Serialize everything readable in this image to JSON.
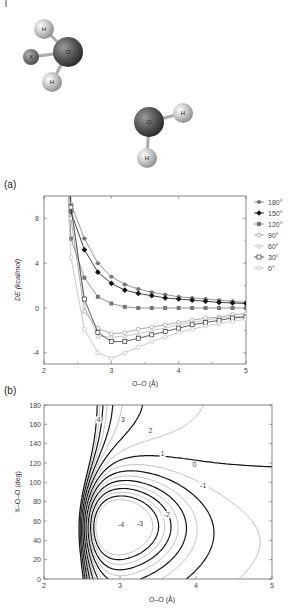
{
  "figure": {
    "molecules": [
      {
        "atoms": [
          {
            "label": "H",
            "x": 44,
            "y": 29,
            "r": 10,
            "fill": "#d8d8d8"
          },
          {
            "label": "X",
            "x": 31,
            "y": 57,
            "r": 8,
            "fill": "#777"
          },
          {
            "label": "O",
            "x": 68,
            "y": 52,
            "r": 15,
            "fill": "#555"
          },
          {
            "label": "H",
            "x": 52,
            "y": 82,
            "r": 10,
            "fill": "#d8d8d8"
          }
        ],
        "bonds": [
          [
            2,
            0
          ],
          [
            2,
            1
          ],
          [
            2,
            3
          ]
        ]
      },
      {
        "atoms": [
          {
            "label": "O",
            "x": 149,
            "y": 122,
            "r": 15,
            "fill": "#555"
          },
          {
            "label": "H",
            "x": 183,
            "y": 113,
            "r": 10,
            "fill": "#d8d8d8"
          },
          {
            "label": "H",
            "x": 147,
            "y": 158,
            "r": 10,
            "fill": "#d8d8d8"
          }
        ],
        "bonds": [
          [
            0,
            1
          ],
          [
            0,
            2
          ]
        ]
      }
    ],
    "panel_a_label": "(a)",
    "panel_b_label": "(b)"
  },
  "chart_data": [
    {
      "type": "line",
      "title": "(a)",
      "xlabel": "O–O (Å)",
      "ylabel": "DE (kcal/mol)",
      "xlim": [
        2,
        5
      ],
      "ylim": [
        -5,
        10
      ],
      "xticks": [
        2,
        3,
        4,
        5
      ],
      "yticks": [
        -4,
        0,
        4,
        8
      ],
      "legend_position": "right",
      "x": [
        2.4,
        2.6,
        2.8,
        3.0,
        3.2,
        3.4,
        3.6,
        3.8,
        4.0,
        4.2,
        4.4,
        4.6,
        4.8,
        5.0
      ],
      "series": [
        {
          "name": "180°",
          "color": "#777",
          "marker": "star",
          "values": [
            9.3,
            6.2,
            4.0,
            2.8,
            2.1,
            1.7,
            1.4,
            1.2,
            1.0,
            0.9,
            0.8,
            0.7,
            0.6,
            0.5
          ]
        },
        {
          "name": "150°",
          "color": "#111",
          "marker": "diamond",
          "values": [
            8.6,
            5.2,
            3.2,
            2.2,
            1.6,
            1.3,
            1.1,
            0.9,
            0.8,
            0.7,
            0.6,
            0.5,
            0.45,
            0.4
          ]
        },
        {
          "name": "120°",
          "color": "#777",
          "marker": "square-filled",
          "values": [
            6.2,
            2.7,
            1.0,
            0.4,
            0.1,
            0.0,
            0.0,
            0.0,
            0.0,
            0.0,
            0.0,
            0.0,
            0.0,
            0.0
          ]
        },
        {
          "name": "90°",
          "color": "#999",
          "marker": "circle-open",
          "values": [
            8.0,
            -0.3,
            -1.8,
            -2.3,
            -2.2,
            -1.9,
            -1.7,
            -1.5,
            -1.3,
            -1.1,
            -0.9,
            -0.8,
            -0.6,
            -0.5
          ]
        },
        {
          "name": "60°",
          "color": "#bbb",
          "marker": "triangle-open",
          "values": [
            9.5,
            0.2,
            -2.5,
            -2.6,
            -2.5,
            -2.3,
            -2.0,
            -1.8,
            -1.5,
            -1.3,
            -1.1,
            -0.9,
            -0.8,
            -0.7
          ]
        },
        {
          "name": "30°",
          "color": "#333",
          "marker": "square-open",
          "values": [
            9.0,
            0.8,
            -2.2,
            -3.0,
            -3.0,
            -2.7,
            -2.4,
            -2.1,
            -1.8,
            -1.5,
            -1.3,
            -1.1,
            -0.9,
            -0.8
          ]
        },
        {
          "name": "0°",
          "color": "#bbb",
          "marker": "circle-open",
          "values": [
            4.5,
            -1.9,
            -4.0,
            -4.5,
            -4.0,
            -3.5,
            -3.0,
            -2.6,
            -2.2,
            -1.9,
            -1.6,
            -1.4,
            -1.2,
            -1.0
          ]
        }
      ]
    },
    {
      "type": "contour",
      "title": "(b)",
      "xlabel": "O–O (Å)",
      "ylabel": "X–O–O (deg)",
      "xlim": [
        2,
        5
      ],
      "ylim": [
        0,
        180
      ],
      "xticks": [
        2,
        3,
        4,
        5
      ],
      "yticks": [
        0,
        20,
        40,
        60,
        80,
        100,
        120,
        140,
        160,
        180
      ],
      "contour_labels": [
        {
          "text": "4",
          "x": 2.72,
          "y": 163
        },
        {
          "text": "3",
          "x": 3.04,
          "y": 163
        },
        {
          "text": "2",
          "x": 3.4,
          "y": 152
        },
        {
          "text": "1",
          "x": 3.56,
          "y": 128
        },
        {
          "text": "0",
          "x": 3.98,
          "y": 117
        },
        {
          "text": "-1",
          "x": 4.08,
          "y": 95
        },
        {
          "text": "-2",
          "x": 3.6,
          "y": 65
        },
        {
          "text": "-3",
          "x": 3.25,
          "y": 56
        },
        {
          "text": "-4",
          "x": 3.0,
          "y": 55
        }
      ],
      "minimum": {
        "x": 2.95,
        "y": 58
      }
    }
  ]
}
